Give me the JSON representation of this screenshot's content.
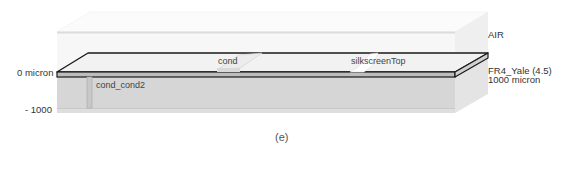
{
  "figure": {
    "caption": "(e)",
    "axis": {
      "top_label": "0 micron",
      "bottom_label": "- 1000"
    },
    "layers": [
      {
        "name": "AIR",
        "label": "AIR"
      },
      {
        "name": "FR4_Yale",
        "label": "FR4_Yale (4.5)",
        "thickness_label": "1000 micron"
      }
    ],
    "objects": [
      {
        "name": "cond",
        "label": "cond"
      },
      {
        "name": "silkscreenTop",
        "label": "silkscreenTop"
      },
      {
        "name": "cond_cond2",
        "label": "cond_cond2"
      }
    ],
    "colors": {
      "air_fill": "#f6f6f6",
      "air_top": "#fbfbfb",
      "board_top": "#f2f2f2",
      "board_edge": "#1a1a1a",
      "board_side": "#bcbcbc",
      "substrate_front": "#d6d6d6",
      "substrate_side": "#e3e3e3",
      "via": "#c4c4c4"
    }
  }
}
